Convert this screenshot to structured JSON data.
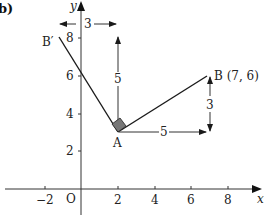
{
  "part_label": "b)",
  "axes": {
    "x_label": "x",
    "y_label": "y",
    "origin_label": "O",
    "x_ticks": [
      "−2",
      "2",
      "4",
      "6",
      "8"
    ],
    "y_ticks": [
      "2",
      "4",
      "6",
      "8"
    ]
  },
  "points": {
    "A": {
      "label": "A",
      "x": 2,
      "y": 3
    },
    "B": {
      "label": "B (7, 6)",
      "x": 7,
      "y": 6
    },
    "B_prime": {
      "label": "B′",
      "x": -1,
      "y": 8
    }
  },
  "dimensions": {
    "horizontal_AB": "5",
    "vertical_AB": "3",
    "vertical_rotated": "5",
    "horizontal_rotated": "3"
  },
  "colors": {
    "line": "#1a1a1a",
    "axis": "#333333",
    "right_angle_fill": "#777777"
  }
}
